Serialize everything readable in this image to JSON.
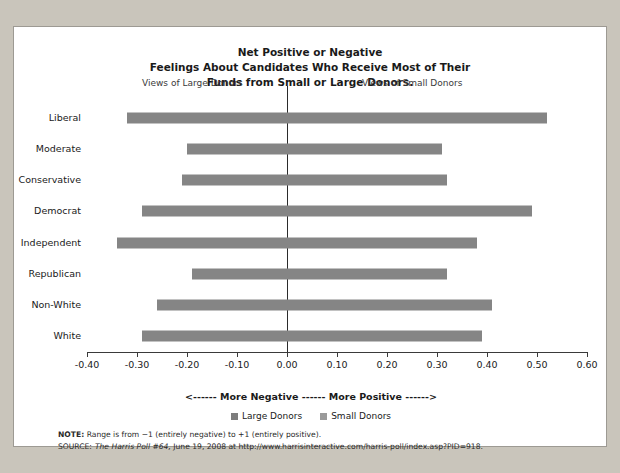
{
  "title": {
    "line1": "Net Positive or Negative",
    "line2": "Feelings About Candidates Who Receive Most of Their",
    "line3": "Funds from Small or Large Donors."
  },
  "headnotes": {
    "left": "Views of Large Donors",
    "right": "Views of Small Donors"
  },
  "axis_caption": "<------ More Negative ------ More Positive ------>",
  "legend": [
    {
      "label": "Large Donors",
      "color": "#7d7d7d"
    },
    {
      "label": "Small Donors",
      "color": "#9a9a9a"
    }
  ],
  "footnotes": {
    "note_label": "NOTE:",
    "note_text": " Range is from −1 (entirely negative) to +1 (entirely positive).",
    "source_label": "SOURCE:",
    "source_italic": "The Harris Poll #64,",
    "source_text": " June 19, 2008 at http://www.harrisinteractive.com/harris-poll/index.asp?PID=918."
  },
  "chart_data": {
    "type": "bar",
    "orientation": "horizontal",
    "title": "Net Positive or Negative Feelings About Candidates Who Receive Most of Their Funds from Small or Large Donors.",
    "xlabel": "<------ More Negative ------ More Positive ------>",
    "ylabel": "",
    "xlim": [
      -0.4,
      0.6
    ],
    "xticks": [
      -0.4,
      -0.3,
      -0.2,
      -0.1,
      0.0,
      0.1,
      0.2,
      0.3,
      0.4,
      0.5,
      0.6
    ],
    "xticklabels": [
      "-0.40",
      "-0.30",
      "-0.20",
      "-0.10",
      "0.00",
      "0.10",
      "0.20",
      "0.30",
      "0.40",
      "0.50",
      "0.60"
    ],
    "grid": false,
    "legend_position": "bottom",
    "categories": [
      "Liberal",
      "Moderate",
      "Conservative",
      "Democrat",
      "Independent",
      "Republican",
      "Non-White",
      "White"
    ],
    "series": [
      {
        "name": "Large Donors",
        "color": "#858585",
        "values": [
          -0.32,
          -0.2,
          -0.21,
          -0.29,
          -0.34,
          -0.19,
          -0.26,
          -0.29
        ]
      },
      {
        "name": "Small Donors",
        "color": "#858585",
        "values": [
          0.52,
          0.31,
          0.32,
          0.49,
          0.38,
          0.32,
          0.41,
          0.39
        ]
      }
    ]
  }
}
